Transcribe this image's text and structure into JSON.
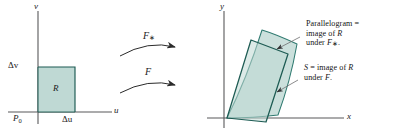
{
  "figure": {
    "type": "math-diagram",
    "colors": {
      "region_fill": "#bfd9d4",
      "region_fill_light": "#cbe0dc",
      "region_stroke_dark": "#1d5b53",
      "region_stroke_mid": "#2f7a70",
      "axis": "#58585a",
      "text": "#1a1a1a",
      "arrow": "#2b2b2b",
      "leader": "#6e6e70",
      "background": "#ffffff"
    }
  },
  "left_plot": {
    "vertical_axis_label": "v",
    "horizontal_axis_label": "u",
    "origin_label": "P",
    "origin_subscript": "0",
    "height_label": "Δv",
    "width_label": "Δu",
    "region_label": "R"
  },
  "arrows": {
    "upper": {
      "label_base": "F",
      "label_star": "∗"
    },
    "lower": {
      "label_base": "F"
    }
  },
  "right_plot": {
    "vertical_axis_label": "y",
    "horizontal_axis_label": "x"
  },
  "callouts": {
    "parallelogram": {
      "line1_text": "Parallelogram =",
      "line2_pre": "image of ",
      "line2_italic": "R",
      "line3_pre": "under ",
      "line3_italic": "F",
      "line3_star": "∗",
      "line3_post": "."
    },
    "surface": {
      "line1_italic": "S",
      "line1_mid": " = image of ",
      "line1_italic2": "R",
      "line2_pre": "under ",
      "line2_italic": "F",
      "line2_post": "."
    }
  }
}
